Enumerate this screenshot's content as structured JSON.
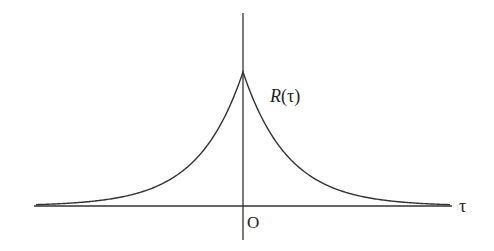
{
  "chart_data": {
    "type": "line",
    "title": "",
    "function": "R(tau) = R0 * exp(-|tau| / k)",
    "curve_label": "R(τ)",
    "xlabel": "τ",
    "ylabel": "",
    "origin_label": "O",
    "grid": false,
    "legend": null,
    "x": [
      -4,
      -3,
      -2,
      -1,
      -0.5,
      0,
      0.5,
      1,
      2,
      3,
      4
    ],
    "series": [
      {
        "name": "R(τ)",
        "values": [
          0.018,
          0.05,
          0.135,
          0.368,
          0.607,
          1.0,
          0.607,
          0.368,
          0.135,
          0.05,
          0.018
        ]
      }
    ],
    "xlim": [
      -4.6,
      4.6
    ],
    "ylim": [
      0,
      1.0
    ],
    "colors": {
      "curve": "#333333",
      "axes": "#333333",
      "text": "#222222"
    }
  },
  "labels": {
    "curve": "R(τ)",
    "x_axis": "τ",
    "origin": "O"
  }
}
